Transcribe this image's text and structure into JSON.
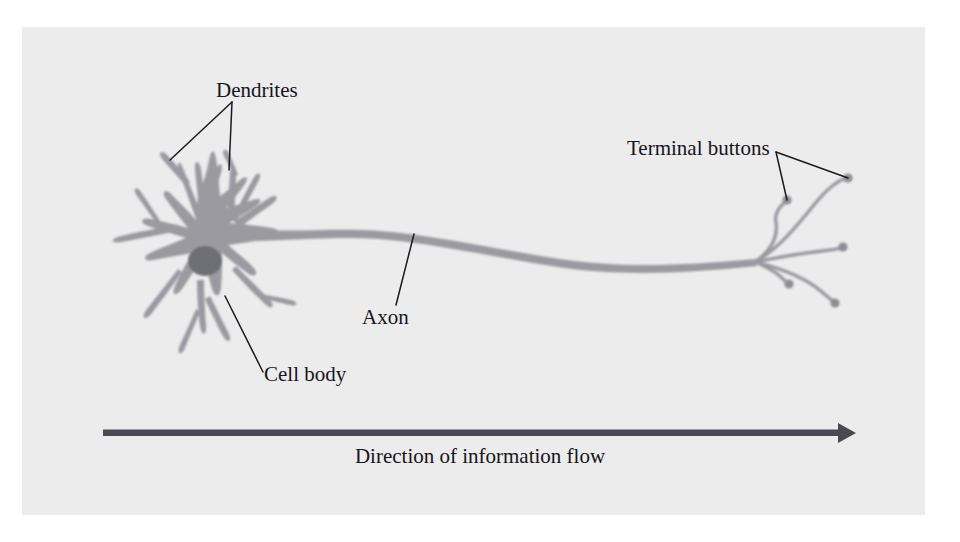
{
  "figure": {
    "type": "diagram",
    "background_color": "#ececed",
    "page_color": "#ffffff",
    "neuron_color": "#9a9aa0",
    "nucleus_color": "#6e6e74",
    "line_color": "#1a1a20",
    "arrow_color": "#4a4a52"
  },
  "labels": {
    "dendrites": "Dendrites",
    "terminal_buttons": "Terminal buttons",
    "axon": "Axon",
    "cell_body": "Cell body",
    "flow_caption": "Direction of information flow"
  },
  "parts": [
    {
      "name": "dendrites",
      "label": "Dendrites",
      "leader_targets": [
        [
          170,
          160
        ],
        [
          229,
          170
        ]
      ],
      "leader_origin": [
        232,
        102
      ]
    },
    {
      "name": "cell-body",
      "label": "Cell body",
      "leader_targets": [
        [
          225,
          296
        ]
      ],
      "leader_origin": [
        263,
        372
      ]
    },
    {
      "name": "axon",
      "label": "Axon",
      "leader_targets": [
        [
          414,
          234
        ]
      ],
      "leader_origin": [
        396,
        305
      ]
    },
    {
      "name": "terminal-buttons",
      "label": "Terminal buttons",
      "leader_targets": [
        [
          787,
          200
        ],
        [
          848,
          178
        ]
      ],
      "leader_origin": [
        776,
        152
      ]
    }
  ],
  "terminal_buttons": {
    "count": 5,
    "endpoints": [
      [
        787,
        200
      ],
      [
        848,
        178
      ],
      [
        843,
        247
      ],
      [
        789,
        284
      ],
      [
        835,
        303
      ]
    ],
    "branch_origin": [
      755,
      262
    ]
  },
  "flow_arrow": {
    "from_x": 103,
    "to_x": 855,
    "y": 433,
    "direction": "left-to-right"
  }
}
